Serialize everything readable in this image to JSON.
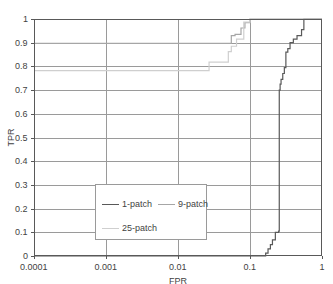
{
  "chart_data": {
    "type": "line",
    "title": "",
    "xlabel": "FPR",
    "ylabel": "TPR",
    "xscale": "log",
    "yscale": "linear",
    "xlim": [
      0.0001,
      1
    ],
    "ylim": [
      0,
      1
    ],
    "grid": true,
    "legend_position": "lower-center",
    "xticks": [
      "0.0001",
      "0.001",
      "0.01",
      "0.1",
      "1"
    ],
    "xtick_values": [
      0.0001,
      0.001,
      0.01,
      0.1,
      1
    ],
    "yticks": [
      "0",
      "0.1",
      "0.2",
      "0.3",
      "0.4",
      "0.5",
      "0.6",
      "0.7",
      "0.8",
      "0.9",
      "1"
    ],
    "ytick_values": [
      0,
      0.1,
      0.2,
      0.3,
      0.4,
      0.5,
      0.6,
      0.7,
      0.8,
      0.9,
      1
    ],
    "series": [
      {
        "name": "1-patch",
        "color": "#595959",
        "x": [
          0.0001,
          0.165,
          0.165,
          0.178,
          0.178,
          0.192,
          0.192,
          0.205,
          0.205,
          0.225,
          0.225,
          0.25,
          0.25,
          0.255,
          0.255,
          0.262,
          0.262,
          0.27,
          0.27,
          0.285,
          0.285,
          0.3,
          0.3,
          0.315,
          0.315,
          0.335,
          0.335,
          0.36,
          0.36,
          0.4,
          0.4,
          0.45,
          0.45,
          0.52,
          0.52,
          0.56,
          0.56,
          1
        ],
        "y": [
          0,
          0,
          0.012,
          0.012,
          0.03,
          0.03,
          0.048,
          0.048,
          0.068,
          0.068,
          0.1,
          0.1,
          0.105,
          0.105,
          0.7,
          0.7,
          0.725,
          0.725,
          0.745,
          0.745,
          0.77,
          0.77,
          0.795,
          0.795,
          0.86,
          0.86,
          0.875,
          0.875,
          0.9,
          0.9,
          0.915,
          0.915,
          0.93,
          0.93,
          0.955,
          0.955,
          1,
          1
        ]
      },
      {
        "name": "9-patch",
        "color": "#a6a6a6",
        "x": [
          0.0001,
          0.055,
          0.055,
          0.062,
          0.062,
          0.075,
          0.075,
          0.085,
          0.085,
          0.1,
          0.1,
          1
        ],
        "y": [
          0.897,
          0.897,
          0.93,
          0.93,
          0.935,
          0.935,
          0.962,
          0.962,
          0.985,
          0.985,
          1,
          1
        ]
      },
      {
        "name": "25-patch",
        "color": "#cfcfcf",
        "x": [
          0.0001,
          0.027,
          0.027,
          0.05,
          0.05,
          0.055,
          0.055,
          0.065,
          0.065,
          0.082,
          0.082,
          0.1,
          0.1,
          1
        ],
        "y": [
          0.782,
          0.782,
          0.818,
          0.818,
          0.862,
          0.862,
          0.885,
          0.885,
          0.915,
          0.915,
          0.987,
          0.987,
          1,
          1
        ]
      }
    ]
  },
  "legend": {
    "entries": [
      {
        "label": "1-patch",
        "color": "#595959"
      },
      {
        "label": "9-patch",
        "color": "#a6a6a6"
      },
      {
        "label": "25-patch",
        "color": "#cfcfcf"
      }
    ]
  },
  "axes": {
    "x_title": "FPR",
    "y_title": "TPR"
  },
  "colors": {
    "axis": "#808080",
    "grid": "#9a9a9a",
    "frame": "#595959",
    "text": "#3f3f3f",
    "background": "#ffffff"
  }
}
